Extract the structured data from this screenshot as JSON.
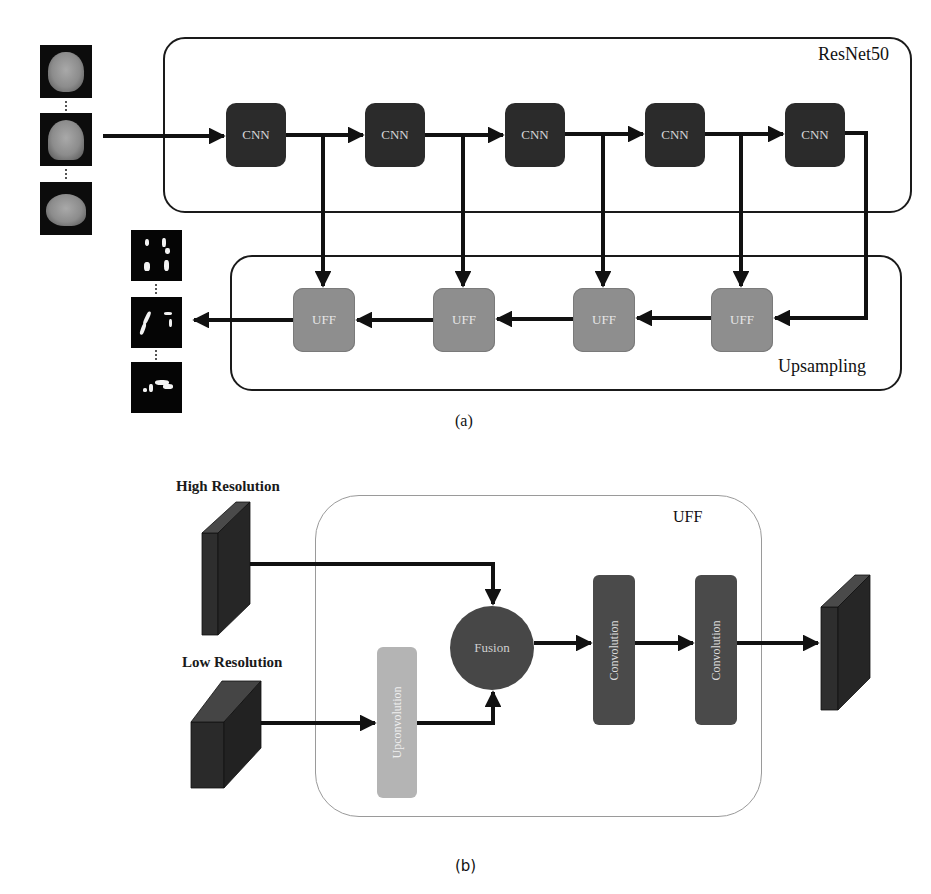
{
  "figure_a": {
    "caption": "(a)",
    "encoder": {
      "label": "ResNet50",
      "blocks": [
        {
          "label": "CNN"
        },
        {
          "label": "CNN"
        },
        {
          "label": "CNN"
        },
        {
          "label": "CNN"
        },
        {
          "label": "CNN"
        }
      ]
    },
    "decoder": {
      "label": "Upsampling",
      "blocks": [
        {
          "label": "UFF"
        },
        {
          "label": "UFF"
        },
        {
          "label": "UFF"
        },
        {
          "label": "UFF"
        }
      ]
    },
    "inputs": [
      "axial-mri",
      "coronal-mri",
      "sagittal-mri"
    ],
    "outputs": [
      "axial-segmentation",
      "coronal-segmentation",
      "sagittal-segmentation"
    ]
  },
  "figure_b": {
    "caption": "(b)",
    "module_label": "UFF",
    "high_res_label": "High Resolution",
    "low_res_label": "Low Resolution",
    "upconv_label": "Upconvolution",
    "fusion_label": "Fusion",
    "conv_labels": [
      "Convolution",
      "Convolution"
    ]
  },
  "colors": {
    "cnn": "#2b2b2b",
    "uff_node": "#8e8e8e",
    "fusion": "#474747",
    "convolution": "#4a4a4a",
    "upconvolution": "#b4b4b4",
    "arrow": "#111111"
  }
}
